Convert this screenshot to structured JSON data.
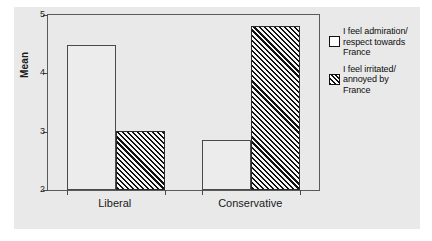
{
  "chart_data": {
    "type": "bar",
    "title": "",
    "xlabel": "",
    "ylabel": "Mean",
    "ylim": [
      2,
      5
    ],
    "yticks": [
      2,
      3,
      4,
      5
    ],
    "ytick_labels": [
      "2",
      "3",
      "4",
      "5"
    ],
    "grid": false,
    "legend_position": "right",
    "categories": [
      "Liberal",
      "Conservative"
    ],
    "series": [
      {
        "name": "I feel admiration/respect towards France",
        "pattern": "open",
        "values": [
          4.48,
          2.86
        ]
      },
      {
        "name": "I feel irritated/annoyed by France",
        "pattern": "diagonal-hatch",
        "values": [
          3.01,
          4.82
        ]
      }
    ]
  },
  "axis": {
    "y_title": "Mean"
  },
  "legend": {
    "entries": [
      {
        "line1": "I feel admiration/",
        "line2": "respect towards",
        "line3": "France",
        "swatch": "open-square-icon"
      },
      {
        "line1": "I feel irritated/",
        "line2": "annoyed by",
        "line3": "France",
        "swatch": "hatched-square-icon"
      }
    ]
  },
  "colors": {
    "panel_background": "#e9e9e9",
    "frame_line": "#5a5a5a",
    "bar_outline": "#4a4a4a",
    "hatch_line": "#101010",
    "open_bar_fill": "#ececec",
    "text": "#1a1a1a"
  }
}
